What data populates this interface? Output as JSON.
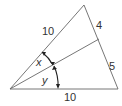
{
  "diagram": {
    "type": "triangle-angle-bisector",
    "stroke_color": "#555555",
    "side_labels": {
      "left_side": "10",
      "right_upper_segment": "4",
      "right_lower_segment": "5",
      "bottom_side": "10"
    },
    "angle_labels": {
      "upper_angle": "x",
      "lower_angle": "y"
    }
  }
}
